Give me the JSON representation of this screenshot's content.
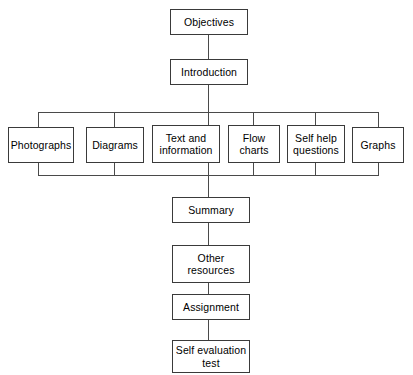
{
  "diagram": {
    "orientation": "top-to-bottom",
    "background_color": "#ffffff",
    "box_border_color": "#3a3a3a",
    "connector_color": "#4a4a4a",
    "text_color": "#000000",
    "nodes": {
      "objectives": "Objectives",
      "introduction": "Introduction",
      "photographs": "Photographs",
      "diagrams": "Diagrams",
      "text_and_information": "Text and\ninformation",
      "flow_charts": "Flow\ncharts",
      "self_help_questions": "Self help\nquestions",
      "graphs": "Graphs",
      "summary": "Summary",
      "other_resources": "Other\nresources",
      "assignment": "Assignment",
      "self_evaluation_test": "Self evaluation\ntest"
    },
    "branch_row_labels": [
      "Photographs",
      "Diagrams",
      "Text and information",
      "Flow charts",
      "Self help questions",
      "Graphs"
    ],
    "main_sequence": [
      "Objectives",
      "Introduction",
      "Summary",
      "Other resources",
      "Assignment",
      "Self evaluation test"
    ]
  }
}
